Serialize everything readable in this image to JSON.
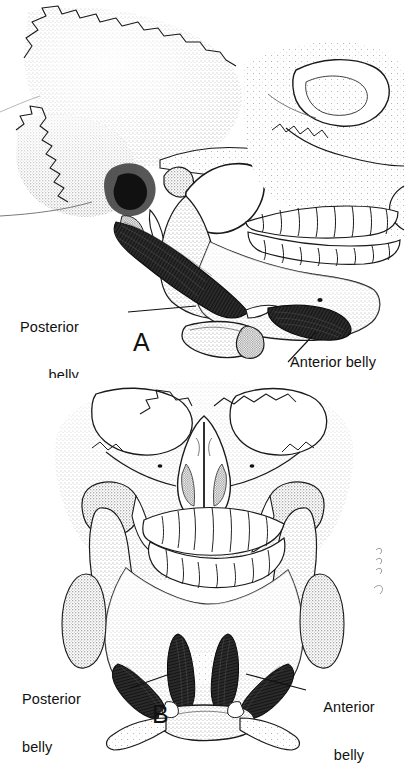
{
  "figure": {
    "background_color": "#ffffff",
    "ink_color": "#111111",
    "style": "stipple line-art anatomical illustration"
  },
  "panels": [
    {
      "letter": "A",
      "view": "lateral view of skull and mandible",
      "labels": [
        {
          "name": "posterior-belly",
          "line1": "Posterior",
          "line2": "belly",
          "text": "Posterior belly"
        },
        {
          "name": "anterior-belly",
          "line1": "Anterior belly",
          "line2": "",
          "text": "Anterior belly"
        }
      ]
    },
    {
      "letter": "B",
      "view": "anterior view of skull and mandible",
      "labels": [
        {
          "name": "posterior-belly",
          "line1": "Posterior",
          "line2": "belly",
          "text": "Posterior belly"
        },
        {
          "name": "anterior-belly",
          "line1": "Anterior",
          "line2": "belly",
          "text": "Anterior belly"
        }
      ]
    }
  ],
  "structures": [
    "temporal bone",
    "zygomatic arch",
    "mandibular condyle",
    "coronoid process",
    "mandibular ramus",
    "mandibular body",
    "maxillary teeth",
    "mandibular teeth",
    "styloid process",
    "mastoid process",
    "hyoid bone",
    "intermediate tendon",
    "nasal aperture",
    "orbit"
  ]
}
